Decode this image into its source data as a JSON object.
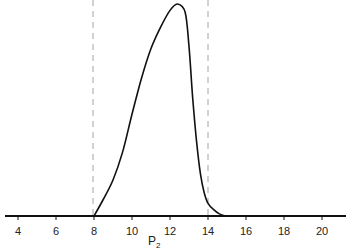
{
  "chart_data": {
    "type": "line",
    "title": "",
    "xlabel": "P2",
    "xlabel_main": "P",
    "xlabel_sub": "2",
    "ylabel": "",
    "xlim": [
      3,
      21.3
    ],
    "ylim": [
      0,
      1
    ],
    "grid": false,
    "legend": null,
    "x_ticks": [
      4,
      6,
      8,
      10,
      12,
      14,
      16,
      18,
      20
    ],
    "x_tick_labels": [
      "4",
      "6",
      "8",
      "10",
      "12",
      "14",
      "16",
      "18",
      "20"
    ],
    "reference_lines": [
      {
        "x": 8,
        "style": "dashed"
      },
      {
        "x": 14,
        "style": "dashed"
      }
    ],
    "series": [
      {
        "name": "density",
        "x": [
          8.0,
          8.5,
          9.0,
          9.5,
          10.0,
          10.5,
          11.0,
          11.5,
          12.0,
          12.4,
          12.8,
          13.0,
          13.2,
          13.4,
          13.6,
          13.8,
          14.0,
          14.3,
          14.6,
          14.9
        ],
        "y": [
          0.0,
          0.08,
          0.17,
          0.3,
          0.48,
          0.65,
          0.79,
          0.89,
          0.97,
          1.0,
          0.96,
          0.8,
          0.55,
          0.35,
          0.2,
          0.11,
          0.06,
          0.03,
          0.01,
          0.0
        ]
      }
    ]
  }
}
